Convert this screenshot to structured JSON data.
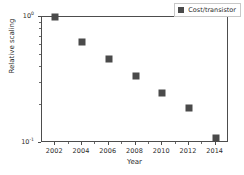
{
  "chart_data": {
    "type": "scatter",
    "title": "",
    "xlabel": "Year",
    "ylabel": "Relative scaling",
    "x": [
      2002,
      2004,
      2006,
      2008,
      2010,
      2012,
      2014
    ],
    "series": [
      {
        "name": "Cost/transistor",
        "values": [
          1.0,
          0.63,
          0.46,
          0.34,
          0.25,
          0.19,
          0.11
        ],
        "marker": "square",
        "color": "#4a4a4a"
      }
    ],
    "xlim": [
      2001,
      2015
    ],
    "ylim": [
      0.1,
      1.0
    ],
    "yscale": "log",
    "xscale": "linear",
    "xticks": [
      2002,
      2004,
      2006,
      2008,
      2010,
      2012,
      2014
    ],
    "xticklabels": [
      "2002",
      "2004",
      "2006",
      "2008",
      "2010",
      "2012",
      "2014"
    ],
    "yticks": [
      1.0,
      0.1
    ],
    "yticklabels": [
      "10^0",
      "10^-1"
    ],
    "ytick_mantissa": [
      "10",
      "10"
    ],
    "ytick_exponent": [
      "0",
      "-1"
    ],
    "yminorticks": [
      0.9,
      0.8,
      0.7,
      0.6,
      0.5,
      0.4,
      0.3,
      0.2
    ],
    "grid": false,
    "legend_position": "upper right",
    "legend_entries": [
      "Cost/transistor"
    ],
    "frame_color": "#4d4d4d",
    "background": "#ffffff"
  },
  "legend": {
    "label": "Cost/transistor",
    "swatch_name": "square-marker-swatch",
    "color": "#4a4a4a"
  },
  "axes": {
    "xlabel": "Year",
    "ylabel": "Relative scaling",
    "xticklabels": [
      "2002",
      "2004",
      "2006",
      "2008",
      "2010",
      "2012",
      "2014"
    ],
    "yticklabels": [
      {
        "mantissa": "10",
        "exponent": "0"
      },
      {
        "mantissa": "10",
        "exponent": "-1"
      }
    ]
  }
}
